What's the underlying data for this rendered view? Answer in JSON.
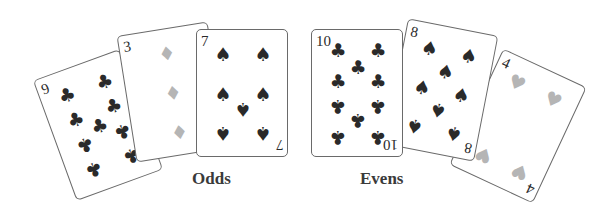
{
  "colors": {
    "black_suit": "#2a2a2a",
    "red_suit_gray": "#b5b5b5",
    "border": "#6a6a6a",
    "label": "#3a3a3a"
  },
  "groups": [
    {
      "label": "Odds",
      "cards": [
        {
          "rank": "9",
          "suit": "clubs",
          "glyph": "♣"
        },
        {
          "rank": "3",
          "suit": "diamonds",
          "glyph": "♦"
        },
        {
          "rank": "7",
          "suit": "spades",
          "glyph": "♠"
        }
      ]
    },
    {
      "label": "Evens",
      "cards": [
        {
          "rank": "10",
          "suit": "clubs",
          "glyph": "♣"
        },
        {
          "rank": "8",
          "suit": "spades",
          "glyph": "♠"
        },
        {
          "rank": "4",
          "suit": "hearts",
          "glyph": "♥"
        }
      ]
    }
  ]
}
